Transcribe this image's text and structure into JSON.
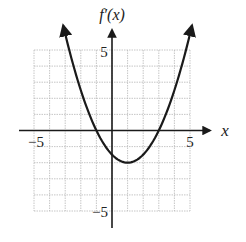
{
  "chart_data": {
    "type": "line",
    "title": "",
    "xlabel": "x",
    "ylabel": "f′(x)",
    "xlim": [
      -5,
      5
    ],
    "ylim": [
      -5,
      5
    ],
    "grid": true,
    "grid_step": 1,
    "x_tick_labels": [
      "−5",
      "5"
    ],
    "y_tick_labels": [
      "5",
      "−5"
    ],
    "series": [
      {
        "name": "f′(x)",
        "function": "0.5*(x-1)^2 - 2",
        "x": [
          -3,
          -2,
          -1,
          0,
          1,
          2,
          3,
          4,
          4.75
        ],
        "values": [
          6,
          2.5,
          0,
          -1.5,
          -2,
          -1.5,
          0,
          2.5,
          5.03
        ]
      }
    ],
    "annotations": {
      "roots": [
        -1,
        3
      ],
      "vertex": [
        1,
        -2
      ]
    },
    "arrows": "curve ends and both axes end in arrowheads"
  },
  "colors": {
    "curve": "#1a1a1a",
    "axes": "#1a1a1a",
    "grid": "#b8b8b8"
  }
}
